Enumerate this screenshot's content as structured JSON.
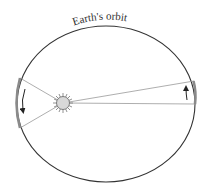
{
  "diagram": {
    "title": "Earth's orbit",
    "elements": {
      "orbit": {
        "label": "Earth's orbit",
        "shape": "ellipse"
      },
      "sun": {
        "label": "Sun",
        "position": "left focus"
      },
      "left_sector": {
        "description": "Narrow-angle sector near aphelion side? swept area, arrow pointing downward (motion)"
      },
      "right_sector": {
        "description": "Thin elongated sector on far side, arrow pointing upward (motion)"
      }
    },
    "colors": {
      "orbit": "#333333",
      "sector_lines": "#999999",
      "arc_highlight": "#8a8a8a",
      "sun_fill": "#d8d8d8",
      "arrow": "#222222",
      "label": "#333333"
    }
  }
}
